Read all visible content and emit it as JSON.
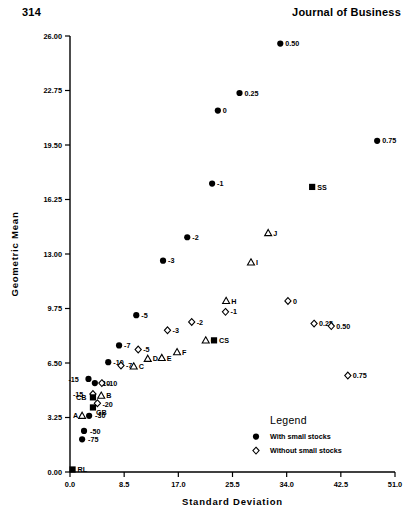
{
  "header": {
    "page_number": "314",
    "journal": "Journal of Business"
  },
  "legend": {
    "title": "Legend",
    "entries": [
      {
        "marker": "filled-circle",
        "label": "With small stocks"
      },
      {
        "marker": "open-diamond",
        "label": "Without small stocks"
      }
    ]
  },
  "chart_data": {
    "type": "scatter",
    "title": "",
    "xlabel": "Standard Deviation",
    "ylabel": "Geometric Mean",
    "xlim": [
      0.0,
      51.0
    ],
    "ylim": [
      0.0,
      26.0
    ],
    "xticks": [
      "0.0",
      "8.5",
      "17.0",
      "25.5",
      "34.0",
      "42.5",
      "51.0"
    ],
    "xtick_values": [
      0.0,
      8.5,
      17.0,
      25.5,
      34.0,
      42.5,
      51.0
    ],
    "yticks": [
      "0.00",
      "3.25",
      "6.50",
      "9.75",
      "13.00",
      "16.25",
      "19.50",
      "22.75",
      "26.00"
    ],
    "ytick_values": [
      0.0,
      3.25,
      6.5,
      9.75,
      13.0,
      16.25,
      19.5,
      22.75,
      26.0
    ],
    "grid": false,
    "legend_position": "bottom-right",
    "series": [
      {
        "name": "With small stocks",
        "marker": "filled-circle",
        "points": [
          {
            "label": "0.50",
            "x": 33.0,
            "y": 25.55,
            "lab_dx": 5,
            "lab_dy": 2.6
          },
          {
            "label": "0.25",
            "x": 26.6,
            "y": 22.6,
            "lab_dx": 5,
            "lab_dy": 2.6
          },
          {
            "label": "0",
            "x": 23.2,
            "y": 21.55,
            "lab_dx": 5,
            "lab_dy": 2.6
          },
          {
            "label": "0.75",
            "x": 48.2,
            "y": 19.75,
            "lab_dx": 5,
            "lab_dy": 2.6
          },
          {
            "label": "-1",
            "x": 22.3,
            "y": 17.2,
            "lab_dx": 5,
            "lab_dy": 2.6
          },
          {
            "label": "-2",
            "x": 18.4,
            "y": 14.0,
            "lab_dx": 5,
            "lab_dy": 2.6
          },
          {
            "label": "-3",
            "x": 14.6,
            "y": 12.6,
            "lab_dx": 5,
            "lab_dy": 2.6
          },
          {
            "label": "-5",
            "x": 10.4,
            "y": 9.35,
            "lab_dx": 5,
            "lab_dy": 2.6
          },
          {
            "label": "-7",
            "x": 7.7,
            "y": 7.55,
            "lab_dx": 5,
            "lab_dy": 2.6
          },
          {
            "label": "-10",
            "x": 6.0,
            "y": 6.55,
            "lab_dx": 5,
            "lab_dy": 2.6
          },
          {
            "label": "-10",
            "x": 3.9,
            "y": 5.3,
            "lab_dx": 5,
            "lab_dy": 2.6
          },
          {
            "label": "-15",
            "x": 2.9,
            "y": 5.55,
            "lab_dx": -20,
            "lab_dy": 2.6
          },
          {
            "label": "-30",
            "x": 3.0,
            "y": 3.35,
            "lab_dx": 6,
            "lab_dy": 2.6
          },
          {
            "label": "-50",
            "x": 2.2,
            "y": 2.45,
            "lab_dx": 6,
            "lab_dy": 2.6
          },
          {
            "label": "-75",
            "x": 1.9,
            "y": 1.95,
            "lab_dx": 6,
            "lab_dy": 2.6
          }
        ]
      },
      {
        "name": "Without small stocks",
        "marker": "open-diamond",
        "points": [
          {
            "label": "0",
            "x": 34.2,
            "y": 10.2,
            "lab_dx": 5,
            "lab_dy": 2.6
          },
          {
            "label": "0.25",
            "x": 38.3,
            "y": 8.85,
            "lab_dx": 5,
            "lab_dy": 2.6
          },
          {
            "label": "0.50",
            "x": 41.0,
            "y": 8.7,
            "lab_dx": 5,
            "lab_dy": 2.6
          },
          {
            "label": "0.75",
            "x": 43.6,
            "y": 5.75,
            "lab_dx": 5,
            "lab_dy": 2.6
          },
          {
            "label": "-1",
            "x": 24.4,
            "y": 9.55,
            "lab_dx": 5,
            "lab_dy": 2.6
          },
          {
            "label": "-2",
            "x": 19.1,
            "y": 8.95,
            "lab_dx": 5,
            "lab_dy": 2.6
          },
          {
            "label": "-3",
            "x": 15.3,
            "y": 8.45,
            "lab_dx": 5,
            "lab_dy": 2.6
          },
          {
            "label": "-5",
            "x": 10.7,
            "y": 7.3,
            "lab_dx": 5,
            "lab_dy": 2.6
          },
          {
            "label": "-7",
            "x": 8.0,
            "y": 6.35,
            "lab_dx": 5,
            "lab_dy": 2.6
          },
          {
            "label": "-10",
            "x": 5.0,
            "y": 5.3,
            "lab_dx": 5,
            "lab_dy": 2.6
          },
          {
            "label": "-15",
            "x": 3.6,
            "y": 4.65,
            "lab_dx": -20,
            "lab_dy": 2.6
          },
          {
            "label": "-20",
            "x": 4.3,
            "y": 4.1,
            "lab_dx": 5,
            "lab_dy": 3.6
          }
        ]
      },
      {
        "name": "Triangles",
        "marker": "open-triangle",
        "points": [
          {
            "label": "J",
            "x": 31.1,
            "y": 14.25,
            "lab_dx": 5,
            "lab_dy": 2.6
          },
          {
            "label": "I",
            "x": 28.4,
            "y": 12.5,
            "lab_dx": 5,
            "lab_dy": 2.6
          },
          {
            "label": "H",
            "x": 24.5,
            "y": 10.2,
            "lab_dx": 5,
            "lab_dy": 2.6
          },
          {
            "label": "G",
            "x": 21.3,
            "y": 7.85,
            "lab_dx": 5,
            "lab_dy": 2.6
          },
          {
            "label": "F",
            "x": 16.8,
            "y": 7.15,
            "lab_dx": 5,
            "lab_dy": 2.6
          },
          {
            "label": "E",
            "x": 14.4,
            "y": 6.8,
            "lab_dx": 5,
            "lab_dy": 2.6
          },
          {
            "label": "D",
            "x": 12.2,
            "y": 6.75,
            "lab_dx": 5,
            "lab_dy": 2.6
          },
          {
            "label": "C",
            "x": 10.0,
            "y": 6.3,
            "lab_dx": 5,
            "lab_dy": 2.6
          },
          {
            "label": "B",
            "x": 4.9,
            "y": 4.55,
            "lab_dx": 5,
            "lab_dy": 2.6
          },
          {
            "label": "A",
            "x": 1.9,
            "y": 3.35,
            "lab_dx": -9,
            "lab_dy": 2.6
          }
        ]
      },
      {
        "name": "Benchmarks",
        "marker": "filled-square",
        "points": [
          {
            "label": "SS",
            "x": 38.0,
            "y": 17.0,
            "lab_dx": 5,
            "lab_dy": 2.6
          },
          {
            "label": "CS",
            "x": 22.6,
            "y": 7.85,
            "lab_dx": 5,
            "lab_dy": 2.6
          },
          {
            "label": "CB",
            "x": 3.6,
            "y": 4.45,
            "lab_dx": -17,
            "lab_dy": 2.6
          },
          {
            "label": "GB",
            "x": 3.6,
            "y": 3.85,
            "lab_dx": 3,
            "lab_dy": 7.5
          },
          {
            "label": "RL",
            "x": 0.4,
            "y": 0.15,
            "lab_dx": 5,
            "lab_dy": 2.6
          }
        ]
      }
    ]
  }
}
